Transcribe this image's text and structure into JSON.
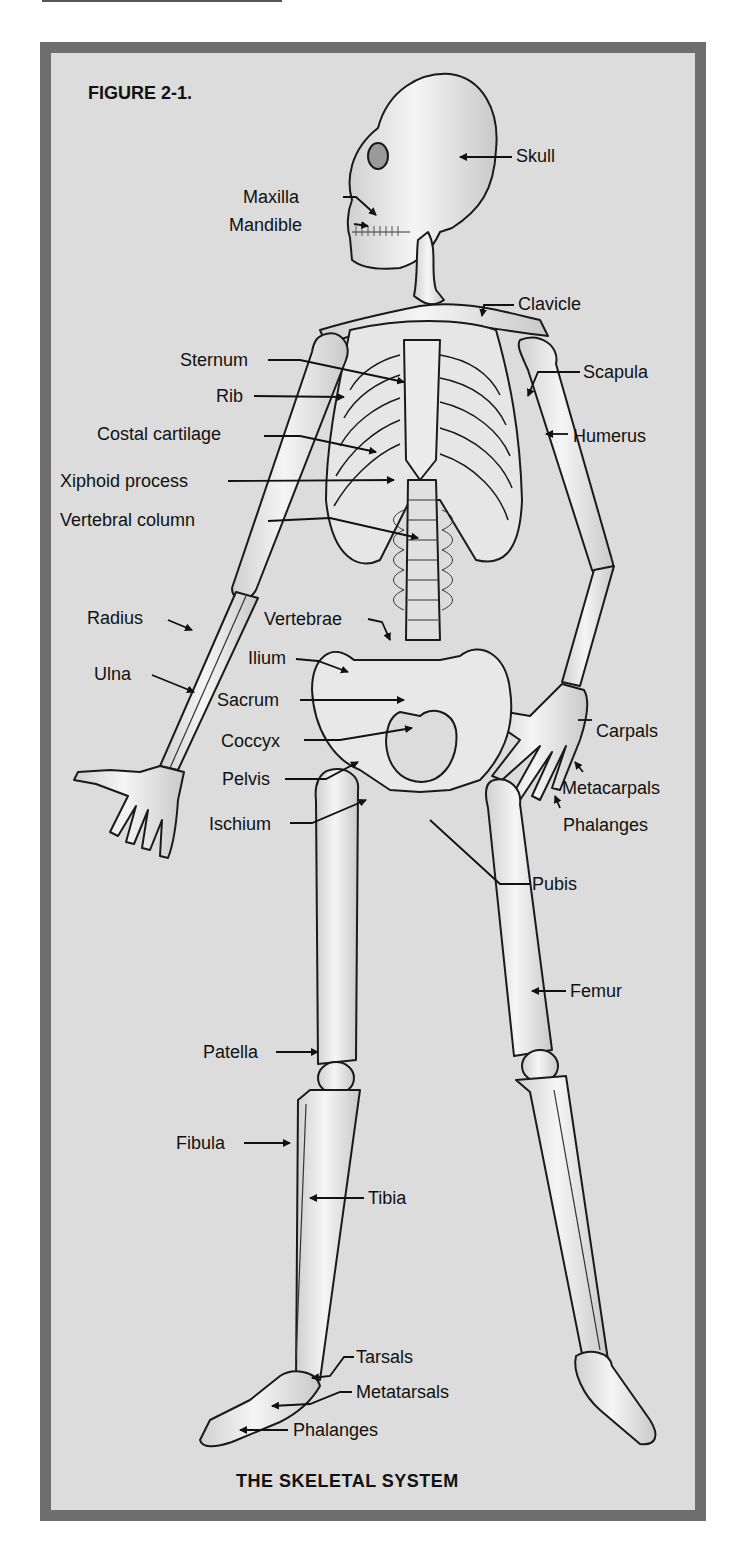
{
  "figure": {
    "title": "FIGURE 2-1.",
    "caption": "THE SKELETAL SYSTEM",
    "colors": {
      "border": "#6e6e6e",
      "panel": "#dcdcdc",
      "bone": "#f2f2f2",
      "bone_shade": "#c8c8c8",
      "outline": "#1a1a1a",
      "text": "#111111"
    }
  },
  "labels": {
    "skull": "Skull",
    "maxilla": "Maxilla",
    "mandible": "Mandible",
    "clavicle": "Clavicle",
    "sternum": "Sternum",
    "scapula": "Scapula",
    "rib": "Rib",
    "humerus": "Humerus",
    "costal_cartilage": "Costal cartilage",
    "xiphoid_process": "Xiphoid process",
    "vertebral_column": "Vertebral column",
    "radius": "Radius",
    "vertebrae": "Vertebrae",
    "ilium": "Ilium",
    "ulna": "Ulna",
    "sacrum": "Sacrum",
    "carpals": "Carpals",
    "coccyx": "Coccyx",
    "pelvis": "Pelvis",
    "metacarpals": "Metacarpals",
    "ischium": "Ischium",
    "phalanges_hand": "Phalanges",
    "pubis": "Pubis",
    "femur": "Femur",
    "patella": "Patella",
    "fibula": "Fibula",
    "tibia": "Tibia",
    "tarsals": "Tarsals",
    "metatarsals": "Metatarsals",
    "phalanges_foot": "Phalanges"
  }
}
